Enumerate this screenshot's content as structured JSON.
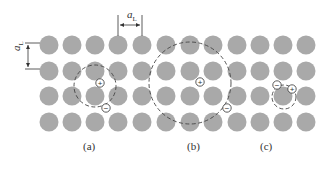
{
  "figure": {
    "lattice": {
      "atom_color": "#a9a9a9",
      "columns_x": [
        49,
        72,
        95,
        118,
        142,
        166,
        190,
        213,
        237,
        260,
        283,
        306
      ],
      "rows_y": [
        45,
        71,
        96,
        122
      ],
      "radius": 9.5
    },
    "dimension_labels": {
      "horizontal": "a",
      "horizontal_sub": "L",
      "vertical": "a",
      "vertical_sub": "L"
    },
    "panels": [
      {
        "label": "(a)",
        "orbit_center": [
          95,
          86
        ],
        "orbit_radius": 21,
        "plus": [
          100,
          83
        ],
        "minus": [
          106,
          108
        ]
      },
      {
        "label": "(b)",
        "orbit_center": [
          190,
          83
        ],
        "orbit_radius": 41,
        "plus": [
          200,
          82
        ],
        "minus": [
          227,
          108
        ]
      },
      {
        "label": "(c)",
        "orbit_center": [
          284,
          97
        ],
        "orbit_radius": 12,
        "plus": [
          292,
          89
        ],
        "minus": [
          277,
          85
        ]
      }
    ],
    "plus_symbol": "+",
    "minus_symbol": "−"
  }
}
